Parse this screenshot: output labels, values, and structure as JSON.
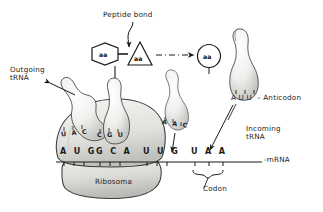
{
  "figure": {
    "title_note": "Peptide bond",
    "labels": {
      "peptide_bond": "Peptide bond",
      "outgoing_trna": "Outgoing\ntRNA",
      "incoming_trna": "Incoming\ntRNA",
      "anticodon_callout": "A U U  – Anticodon",
      "mrna": "-mRNA",
      "codon": "Codon",
      "ribosome": "Ribosoma"
    },
    "amino_acids": [
      {
        "shape": "hexagon",
        "label": "aa"
      },
      {
        "shape": "triangle",
        "label": "aa"
      },
      {
        "shape": "circle",
        "label": "aa"
      }
    ],
    "mrna_strand": {
      "codons": [
        {
          "bases": "A U G",
          "paired": true
        },
        {
          "bases": "G C A",
          "paired": true
        },
        {
          "bases": "U U G",
          "paired": false
        },
        {
          "bases": "U A A",
          "paired": false
        }
      ],
      "end_label": "-mRNA"
    },
    "trnas": [
      {
        "role": "outgoing",
        "anticodon": "U A C",
        "state": "leaving"
      },
      {
        "role": "bound",
        "anticodon": "C G U",
        "state": "in-ribosome"
      },
      {
        "role": "arriving",
        "anticodon": "A A C",
        "state": "descending"
      },
      {
        "role": "incoming",
        "anticodon": "A U U",
        "state": "free"
      }
    ],
    "colors": {
      "ink": "#1b1b1b",
      "background": "#ffffff",
      "body_fill": "#e8e8e6",
      "body_shade": "#c9c9c6",
      "trna_fill": "#f2f2f0"
    }
  }
}
